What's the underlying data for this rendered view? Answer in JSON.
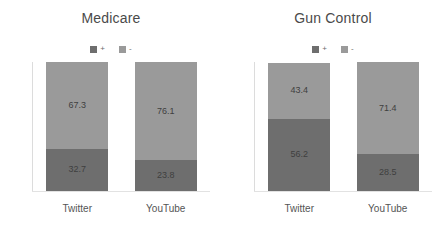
{
  "chart_data": [
    {
      "type": "bar",
      "title": "Medicare",
      "subtype": "stacked-100-percent",
      "categories": [
        "Twitter",
        "YouTube"
      ],
      "series": [
        {
          "name": "+",
          "values": [
            67.3,
            76.1
          ],
          "color": "#9a9a9a"
        },
        {
          "name": "-",
          "values": [
            32.7,
            23.8
          ],
          "color": "#6e6e6e"
        }
      ],
      "xlabel": "",
      "ylabel": "",
      "ylim": [
        0,
        100
      ],
      "grid": false,
      "legend_position": "top-center",
      "stack_order_top_to_bottom": [
        "+",
        "-"
      ]
    },
    {
      "type": "bar",
      "title": "Gun Control",
      "subtype": "stacked-100-percent",
      "categories": [
        "Twitter",
        "YouTube"
      ],
      "series": [
        {
          "name": "+",
          "values": [
            43.4,
            71.4
          ],
          "color": "#9a9a9a"
        },
        {
          "name": "-",
          "values": [
            56.2,
            28.5
          ],
          "color": "#6e6e6e"
        }
      ],
      "xlabel": "",
      "ylabel": "",
      "ylim": [
        0,
        100
      ],
      "grid": false,
      "legend_position": "top-center",
      "stack_order_top_to_bottom": [
        "+",
        "-"
      ]
    }
  ],
  "panels": [
    {
      "title": "Medicare",
      "legend": [
        {
          "label": "+",
          "color": "#6e6e6e"
        },
        {
          "label": "-",
          "color": "#9a9a9a"
        }
      ],
      "bars": [
        {
          "category": "Twitter",
          "pos_value": "67.3",
          "neg_value": "32.7",
          "pos_pct": 67.3,
          "neg_pct": 32.7
        },
        {
          "category": "YouTube",
          "pos_value": "76.1",
          "neg_value": "23.8",
          "pos_pct": 76.1,
          "neg_pct": 23.8
        }
      ]
    },
    {
      "title": "Gun Control",
      "legend": [
        {
          "label": "+",
          "color": "#6e6e6e"
        },
        {
          "label": "-",
          "color": "#9a9a9a"
        }
      ],
      "bars": [
        {
          "category": "Twitter",
          "pos_value": "43.4",
          "neg_value": "56.2",
          "pos_pct": 43.4,
          "neg_pct": 56.2
        },
        {
          "category": "YouTube",
          "pos_value": "71.4",
          "neg_value": "28.5",
          "pos_pct": 71.4,
          "neg_pct": 28.5
        }
      ]
    }
  ],
  "colors": {
    "segment_positive": "#9a9a9a",
    "segment_negative": "#6e6e6e",
    "title_text": "#4a4a4a",
    "label_text": "#555555",
    "value_text": "#3f3f3f",
    "axis": "#dcdcdc",
    "background": "#ffffff"
  }
}
